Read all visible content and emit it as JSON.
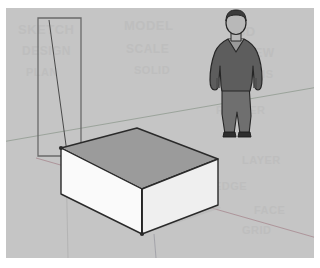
{
  "app": {
    "name": "3D Modeling Viewport",
    "view_style": "shaded-with-textures",
    "background_color": "#c5c5c5",
    "matte_color": "#ffffff"
  },
  "scene": {
    "title": "Box with scale figure",
    "axes": {
      "red_axis_label": "red-axis",
      "red_axis_color": "#a88a91",
      "green_axis_label": "green-axis",
      "green_axis_color": "#8e9a8e",
      "ground_line_color": "#6f6f6f"
    },
    "ground": {
      "name": "ground-plane",
      "color": "#c5c5c5",
      "shadow_color": "#b6b6b6"
    },
    "box": {
      "name": "box-solid",
      "top_face_color": "#9b9b9b",
      "front_left_face_color": "#fafafa",
      "front_right_face_color": "#efefef",
      "edge_color": "#2a2a2a",
      "edge_width": "1.4"
    },
    "guide_rectangle": {
      "name": "guide-rectangle",
      "stroke_color": "#6a6a6a",
      "fill": "none",
      "diagonal_color": "#3a3a3a"
    },
    "figure": {
      "name": "scale-figure-person",
      "description": "Standing man, hands in pockets",
      "hair_color": "#3c3c3c",
      "face_color": "#b8b8b8",
      "sweater_color": "#5d5d5d",
      "trousers_color": "#6f6f6f",
      "shoe_color": "#2e2e2e",
      "outline_color": "#262626"
    }
  },
  "watermark": {
    "color": "#b9b9b9",
    "lines": [
      {
        "text": "SKETCH",
        "x": 12,
        "y": 14,
        "size": 13,
        "rotate": 0
      },
      {
        "text": "MODEL",
        "x": 118,
        "y": 10,
        "size": 13,
        "rotate": 0
      },
      {
        "text": "3D",
        "x": 232,
        "y": 16,
        "size": 13,
        "rotate": 0
      },
      {
        "text": "DESIGN",
        "x": 16,
        "y": 36,
        "size": 12,
        "rotate": 0
      },
      {
        "text": "SCALE",
        "x": 120,
        "y": 34,
        "size": 12,
        "rotate": 0
      },
      {
        "text": "VIEW",
        "x": 236,
        "y": 38,
        "size": 12,
        "rotate": 0
      },
      {
        "text": "PLAN",
        "x": 20,
        "y": 58,
        "size": 11,
        "rotate": 0
      },
      {
        "text": "SOLID",
        "x": 128,
        "y": 56,
        "size": 11,
        "rotate": 0
      },
      {
        "text": "AXIS",
        "x": 240,
        "y": 60,
        "size": 11,
        "rotate": 0
      },
      {
        "text": "RENDER",
        "x": 210,
        "y": 96,
        "size": 11,
        "rotate": 0
      },
      {
        "text": "SHADE",
        "x": 150,
        "y": 150,
        "size": 11,
        "rotate": 0
      },
      {
        "text": "LAYER",
        "x": 236,
        "y": 146,
        "size": 11,
        "rotate": 0
      },
      {
        "text": "EDGE",
        "x": 208,
        "y": 172,
        "size": 11,
        "rotate": 0
      },
      {
        "text": "FACE",
        "x": 248,
        "y": 196,
        "size": 11,
        "rotate": 0
      },
      {
        "text": "GRID",
        "x": 236,
        "y": 216,
        "size": 11,
        "rotate": 0
      }
    ]
  }
}
